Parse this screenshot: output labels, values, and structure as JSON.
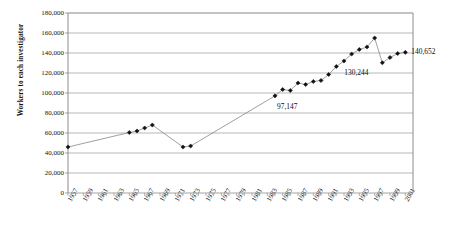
{
  "chart_data": {
    "type": "line",
    "title": "",
    "subtitle": "",
    "xlabel": "",
    "ylabel": "Workers to each investigator",
    "ylim": [
      0,
      180000
    ],
    "ytick_step": 20000,
    "yticks": [
      "0",
      "20,000",
      "40,000",
      "60,000",
      "80,000",
      "100,000",
      "120,000",
      "140,000",
      "160,000",
      "180,000"
    ],
    "ytick_values": [
      0,
      20000,
      40000,
      60000,
      80000,
      100000,
      120000,
      140000,
      160000,
      180000
    ],
    "xlim": [
      1957,
      2002
    ],
    "xticks": [
      "1957",
      "1959",
      "1961",
      "1963",
      "1965",
      "1967",
      "1969",
      "1971",
      "1973",
      "1975",
      "1977",
      "1979",
      "1981",
      "1983",
      "1985",
      "1987",
      "1989",
      "1991",
      "1993",
      "1995",
      "1997",
      "1999",
      "2001"
    ],
    "xtick_values": [
      1957,
      1959,
      1961,
      1963,
      1965,
      1967,
      1969,
      1971,
      1973,
      1975,
      1977,
      1979,
      1981,
      1983,
      1985,
      1987,
      1989,
      1991,
      1993,
      1995,
      1997,
      1999,
      2001
    ],
    "grid": "horizontal",
    "legend": "none",
    "marker": "diamond",
    "line_color": "#888888",
    "marker_color": "#111111",
    "grid_color": "#9a9a9a",
    "axis_color": "#808080",
    "series": [
      {
        "name": "Workers to each investigator",
        "x": [
          1957,
          1965,
          1966,
          1967,
          1968,
          1972,
          1973,
          1984,
          1985,
          1986,
          1987,
          1988,
          1989,
          1990,
          1991,
          1992,
          1993,
          1994,
          1995,
          1996,
          1997,
          1998,
          1999,
          2000,
          2001
        ],
        "values": [
          46000,
          60500,
          62000,
          65000,
          68000,
          46000,
          47000,
          97147,
          103500,
          102500,
          110000,
          108500,
          111500,
          112500,
          118500,
          126500,
          132000,
          139000,
          143500,
          146000,
          155000,
          130244,
          135500,
          139500,
          140652
        ]
      }
    ],
    "annotations": [
      {
        "label": "97,147",
        "x": 1984,
        "y": 97147,
        "anchor": "below-right"
      },
      {
        "label": "130,244",
        "x": 1998,
        "y": 130244,
        "anchor": "below-left"
      },
      {
        "label": "140,652",
        "x": 2001,
        "y": 140652,
        "anchor": "right"
      }
    ]
  }
}
